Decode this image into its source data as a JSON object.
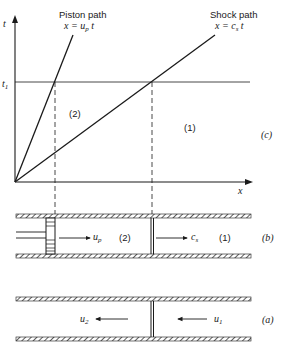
{
  "diagram": {
    "panel_c": {
      "label": "(c)",
      "y_axis_label": "t",
      "x_axis_label": "x",
      "t1_label": "t",
      "t1_sub": "1",
      "piston_path": {
        "title": "Piston path",
        "eq_prefix": "x = u",
        "eq_sub": "p",
        "eq_suffix": " t"
      },
      "shock_path": {
        "title": "Shock path",
        "eq_prefix": "x = c",
        "eq_sub": "s",
        "eq_suffix": " t"
      },
      "region_2": "(2)",
      "region_1": "(1)"
    },
    "panel_b": {
      "label": "(b)",
      "piston_velocity": "u",
      "piston_velocity_sub": "p",
      "shock_velocity": "c",
      "shock_velocity_sub": "s",
      "region_2": "(2)",
      "region_1": "(1)"
    },
    "panel_a": {
      "label": "(a)",
      "u2": "u",
      "u2_sub": "2",
      "u1": "u",
      "u1_sub": "1"
    }
  }
}
